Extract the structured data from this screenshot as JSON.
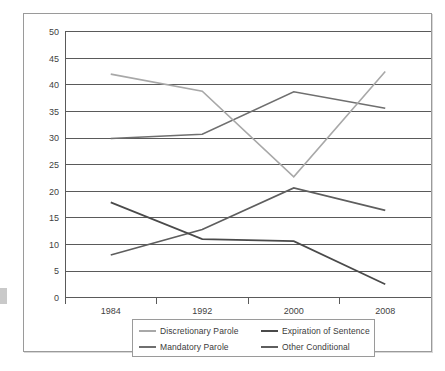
{
  "chart_data": {
    "type": "line",
    "title": "",
    "subtitle": "",
    "xlabel": "",
    "ylabel": "",
    "x": [
      1984,
      1992,
      2000,
      2008
    ],
    "categories": [
      "1984",
      "1992",
      "2000",
      "2008"
    ],
    "xticklabels": [
      "1984",
      "1992",
      "2000",
      "2008"
    ],
    "yticklabels": [
      "0",
      "5",
      "10",
      "15",
      "20",
      "25",
      "30",
      "35",
      "40",
      "45",
      "50"
    ],
    "ylim": [
      0,
      50
    ],
    "ytick_step": 5,
    "grid": "horizontal",
    "legend_position": "bottom",
    "series": [
      {
        "name": "Discretionary Parole",
        "color": "#a8a8a8",
        "values": [
          42.0,
          38.8,
          22.7,
          42.5
        ]
      },
      {
        "name": "Expiration of Sentence",
        "color": "#4a4a4a",
        "values": [
          17.9,
          11.0,
          10.6,
          2.5
        ]
      },
      {
        "name": "Mandatory Parole",
        "color": "#6f6f6f",
        "values": [
          29.9,
          30.7,
          38.7,
          35.6
        ]
      },
      {
        "name": "Other Conditional",
        "color": "#5e5e5e",
        "values": [
          8.0,
          12.8,
          20.6,
          16.4
        ]
      }
    ]
  },
  "legend": {
    "entries": [
      {
        "label": "Discretionary Parole"
      },
      {
        "label": "Expiration of Sentence"
      },
      {
        "label": "Mandatory Parole"
      },
      {
        "label": "Other Conditional"
      }
    ]
  },
  "colors": {
    "frame_border": "#9a9a9a",
    "gridline": "#5a5a5a",
    "axis": "#5a5a5a",
    "tick_text": "#3f3f3f",
    "background": "#ffffff"
  }
}
